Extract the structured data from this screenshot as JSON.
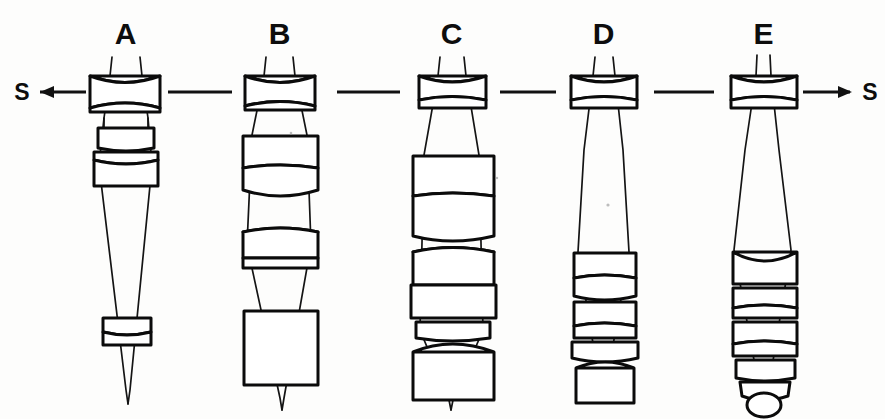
{
  "figure": {
    "background_color": "#fdfdfc",
    "ink_color": "#0d0d0d",
    "width": 885,
    "height": 419
  },
  "axis": {
    "y": 92,
    "left_marker": "S",
    "right_marker": "S",
    "left_arrow_direction": "left",
    "right_arrow_direction": "right",
    "separator_count": 4,
    "separator_label": "dash"
  },
  "columns": [
    {
      "id": "A",
      "label": "A",
      "label_x": 125,
      "label_y": 44,
      "center_x": 124,
      "group_count": 3,
      "description": "Wide setting: front negative group, close variator pair, small rear group far back, steeply converging cone"
    },
    {
      "id": "B",
      "label": "B",
      "label_x": 279,
      "label_y": 44,
      "center_x": 279,
      "group_count": 4,
      "description": "Front negative group, two mid groups, large rear block"
    },
    {
      "id": "C",
      "label": "C",
      "label_x": 451,
      "label_y": 44,
      "center_x": 451,
      "group_count": 5,
      "description": "Front negative group, stacked large variator blocks, thin stop element, large rear block"
    },
    {
      "id": "D",
      "label": "D",
      "label_x": 603,
      "label_y": 44,
      "center_x": 603,
      "group_count": 5,
      "description": "Front negative group, long air gap, compact rear stack"
    },
    {
      "id": "E",
      "label": "E",
      "label_x": 763,
      "label_y": 44,
      "center_x": 763,
      "group_count": 7,
      "description": "Telephoto setting: front negative group, very long air gap, tapering tail stack ending in small ball element"
    }
  ],
  "legend": {
    "s_meaning": "S",
    "hatching": "cross-hatch glass section fill"
  }
}
